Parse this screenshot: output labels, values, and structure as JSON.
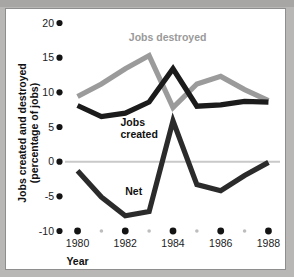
{
  "chart_data": {
    "type": "line",
    "title": "",
    "xlabel": "Year",
    "ylabel": "Jobs created and destroyed (percentage of jobs)",
    "ylabel_line1": "Jobs created and destroyed",
    "ylabel_line2": "(percentage of jobs)",
    "x": [
      1980,
      1981,
      1982,
      1983,
      1984,
      1985,
      1986,
      1987,
      1988
    ],
    "xlim": [
      1979.6,
      1988.4
    ],
    "ylim": [
      -10,
      20
    ],
    "yticks": [
      20,
      15,
      10,
      5,
      0,
      -5,
      -10
    ],
    "ytick_labels": [
      "20",
      "15",
      "10",
      "5",
      "0",
      "-5",
      "-10"
    ],
    "xticks_major": [
      1980,
      1982,
      1984,
      1986,
      1988
    ],
    "xtick_labels": [
      "1980",
      "1982",
      "1984",
      "1986",
      "1988"
    ],
    "xticks_minor": [
      1981,
      1983,
      1985,
      1987
    ],
    "grid": false,
    "zero_line": true,
    "legend": "inline-annotations",
    "series": [
      {
        "name": "Jobs destroyed",
        "color": "#9b9b9b",
        "label_x": 1982.15,
        "label_y": 17.4,
        "values": [
          9.4,
          11.2,
          13.4,
          15.3,
          7.8,
          11.2,
          12.3,
          10.4,
          8.8
        ]
      },
      {
        "name": "Jobs created",
        "color": "#1b1b1b",
        "label_line1": "Jobs",
        "label_line2": "created",
        "label_x": 1981.8,
        "label_y": 5.2,
        "values": [
          8.1,
          6.5,
          7.0,
          8.6,
          13.4,
          8.0,
          8.2,
          8.7,
          8.6
        ]
      },
      {
        "name": "Net",
        "color": "#2b2b2b",
        "label_x": 1982.0,
        "label_y": -4.8,
        "values": [
          -1.3,
          -5.1,
          -7.8,
          -7.2,
          5.9,
          -3.3,
          -4.2,
          -2.0,
          -0.1
        ]
      }
    ]
  }
}
